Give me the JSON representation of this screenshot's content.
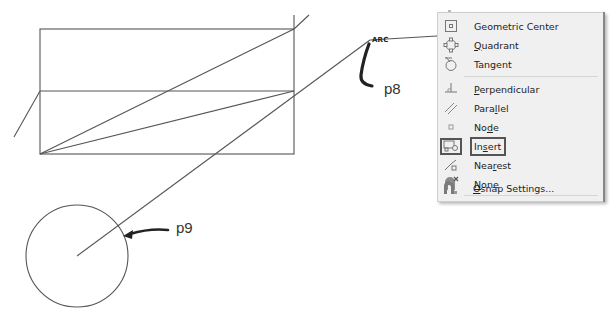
{
  "drawing": {
    "labels": {
      "p8": "p8",
      "p9": "p9",
      "arc_marker": "ARC"
    },
    "stroke_color": "#555555",
    "arrow_color": "#222222"
  },
  "osnap_menu": {
    "items": [
      {
        "label": "Geometric Center",
        "icon": "geometric-center-icon",
        "underline": null
      },
      {
        "label": "Quadrant",
        "icon": "quadrant-icon",
        "underline": "Q"
      },
      {
        "label": "Tangent",
        "icon": "tangent-icon",
        "underline": null
      },
      {
        "label": "Perpendicular",
        "icon": "perpendicular-icon",
        "underline": "P"
      },
      {
        "label": "Parallel",
        "icon": "parallel-icon",
        "underline": "l"
      },
      {
        "label": "Node",
        "icon": "node-icon",
        "underline": "d"
      },
      {
        "label": "Insert",
        "icon": "insert-icon",
        "underline": "s",
        "active": true
      },
      {
        "label": "Nearest",
        "icon": "nearest-icon",
        "underline": "r"
      },
      {
        "label": "None",
        "icon": "none-icon",
        "underline": "N"
      },
      {
        "label": "Osnap Settings...",
        "icon": "osnap-settings-icon",
        "underline": "O"
      }
    ],
    "colors": {
      "background": "#f0f0f0",
      "separator": "#d5d5d5",
      "active_border": "#555555",
      "text": "#222222"
    }
  }
}
